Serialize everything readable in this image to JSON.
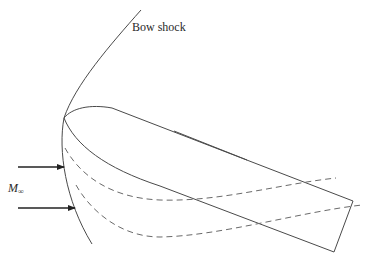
{
  "figure": {
    "labels": {
      "bow_shock": "Bow shock",
      "freestream_mach_symbol": "M",
      "freestream_mach_subscript": "∞"
    },
    "colors": {
      "line": "#4a4a4a",
      "arrow": "#222222",
      "dashed": "#6a6a6a"
    },
    "elements": [
      "bow-shock-curve",
      "body-outline",
      "inner-reference-line",
      "upper-streamline-dashed",
      "lower-streamline-dashed",
      "freestream-arrow-upper",
      "freestream-arrow-lower"
    ]
  }
}
